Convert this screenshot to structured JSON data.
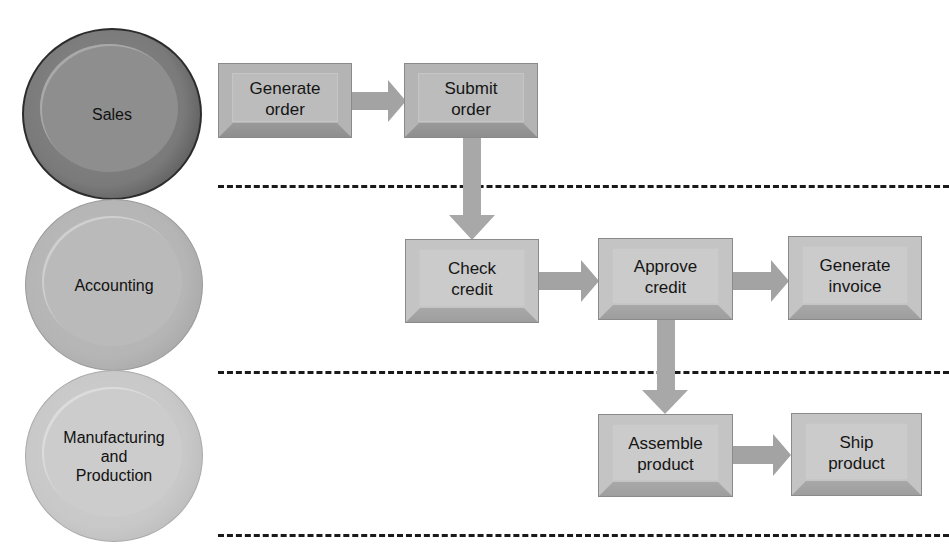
{
  "diagram": {
    "type": "swimlane-process-flow",
    "lanes": [
      {
        "id": "sales",
        "label": "Sales"
      },
      {
        "id": "accounting",
        "label": "Accounting"
      },
      {
        "id": "manufacturing",
        "label": "Manufacturing\nand\nProduction"
      }
    ],
    "steps": [
      {
        "id": "generate_order",
        "lane": "sales",
        "label": "Generate\norder"
      },
      {
        "id": "submit_order",
        "lane": "sales",
        "label": "Submit\norder"
      },
      {
        "id": "check_credit",
        "lane": "accounting",
        "label": "Check\ncredit"
      },
      {
        "id": "approve_credit",
        "lane": "accounting",
        "label": "Approve\ncredit"
      },
      {
        "id": "generate_invoice",
        "lane": "accounting",
        "label": "Generate\ninvoice"
      },
      {
        "id": "assemble_product",
        "lane": "manufacturing",
        "label": "Assemble\nproduct"
      },
      {
        "id": "ship_product",
        "lane": "manufacturing",
        "label": "Ship\nproduct"
      }
    ],
    "connections": [
      {
        "from": "generate_order",
        "to": "submit_order"
      },
      {
        "from": "submit_order",
        "to": "check_credit"
      },
      {
        "from": "check_credit",
        "to": "approve_credit"
      },
      {
        "from": "approve_credit",
        "to": "generate_invoice"
      },
      {
        "from": "approve_credit",
        "to": "assemble_product"
      },
      {
        "from": "assemble_product",
        "to": "ship_product"
      }
    ],
    "colors": {
      "sales_lane": "#7a7a7a",
      "accounting_lane": "#b5b5b5",
      "manufacturing_lane": "#c8c8c8",
      "box_fill": "#b8b8b8",
      "arrow": "#a0a0a0",
      "divider": "#1a1a1a"
    }
  }
}
